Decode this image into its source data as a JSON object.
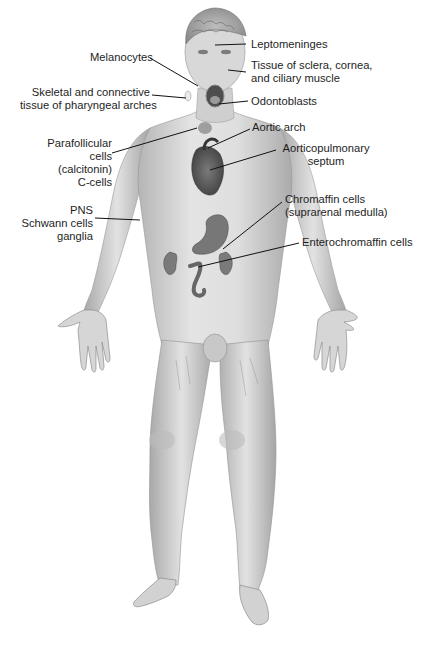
{
  "figure": {
    "labels": {
      "leptomeninges": [
        "Leptomeninges"
      ],
      "melanocytes": [
        "Melanocytes"
      ],
      "sclera": [
        "Tissue of sclera, cornea,",
        "and ciliary muscle"
      ],
      "skeletal": [
        "Skeletal and connective",
        "tissue of pharyngeal arches"
      ],
      "odontoblasts": [
        "Odontoblasts"
      ],
      "aortic_arch": [
        "Aortic arch"
      ],
      "parafollicular": [
        "Parafollicular",
        "cells",
        "(calcitonin)",
        "C-cells"
      ],
      "aorticopulmonary": [
        "Aorticopulmonary",
        "septum"
      ],
      "chromaffin": [
        "Chromaffin cells",
        "(suprarenal medulla)"
      ],
      "pns": [
        "PNS",
        "Schwann cells",
        "ganglia"
      ],
      "enterochromaffin": [
        "Enterochromaffin cells"
      ]
    },
    "colors": {
      "skin": "#d9d9d9",
      "skin_shadow": "#a8a8a8",
      "organ": "#6e6e6e",
      "leader_line": "#111111",
      "text": "#1e1e1e"
    }
  },
  "caption": {
    "partial_text": "(cropped caption line, illegible)"
  }
}
